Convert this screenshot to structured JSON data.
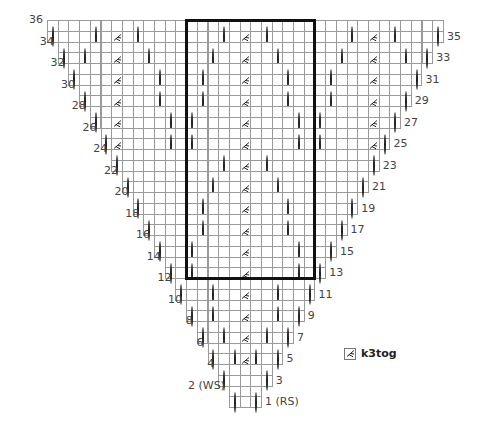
{
  "chart": {
    "columns": 37,
    "grid_origin": {
      "x": 47,
      "y": 20
    },
    "cell_w": 10.7,
    "cell_h": 10.75,
    "total_rows": 36,
    "symbols": {
      "o": "yarn over",
      "p": "purl (dot)",
      "k": "k3tog"
    },
    "repeat_box": {
      "col_start": 13,
      "col_end": 24,
      "row_top": 36,
      "row_bottom": 13
    },
    "rows": [
      {
        "row": 36,
        "label": "36",
        "side": "left",
        "start": 0,
        "end": 36,
        "marks": {
          "0": "p",
          "12": "p",
          "24": "p",
          "36": "p"
        }
      },
      {
        "row": 35,
        "label": "35",
        "side": "right",
        "start": 0,
        "end": 36,
        "marks": {
          "0": "o",
          "4": "o",
          "6": "k",
          "8": "o",
          "12": "p",
          "16": "o",
          "18": "k",
          "20": "o",
          "24": "p",
          "28": "o",
          "30": "k",
          "32": "o",
          "36": "o"
        }
      },
      {
        "row": 34,
        "label": "34",
        "side": "left",
        "start": 1,
        "end": 35,
        "marks": {
          "12": "p",
          "24": "p"
        }
      },
      {
        "row": 33,
        "label": "33",
        "side": "right",
        "start": 1,
        "end": 35,
        "marks": {
          "1": "o",
          "3": "o",
          "6": "k",
          "9": "o",
          "12": "p",
          "15": "o",
          "18": "k",
          "21": "o",
          "24": "p",
          "27": "o",
          "30": "k",
          "33": "o",
          "35": "o"
        }
      },
      {
        "row": 32,
        "label": "32",
        "side": "left",
        "start": 2,
        "end": 34,
        "marks": {
          "12": "p",
          "24": "p"
        }
      },
      {
        "row": 31,
        "label": "31",
        "side": "right",
        "start": 2,
        "end": 34,
        "marks": {
          "2": "o",
          "6": "k",
          "10": "o",
          "12": "p",
          "14": "o",
          "18": "k",
          "22": "o",
          "24": "p",
          "26": "o",
          "30": "k",
          "34": "o"
        }
      },
      {
        "row": 30,
        "label": "30",
        "side": "left",
        "start": 3,
        "end": 33,
        "marks": {
          "12": "p",
          "24": "p"
        }
      },
      {
        "row": 29,
        "label": "29",
        "side": "right",
        "start": 3,
        "end": 33,
        "marks": {
          "3": "o",
          "6": "k",
          "10": "o",
          "12": "p",
          "14": "o",
          "18": "k",
          "22": "o",
          "24": "p",
          "26": "o",
          "30": "k",
          "33": "o"
        }
      },
      {
        "row": 28,
        "label": "28",
        "side": "left",
        "start": 4,
        "end": 32,
        "marks": {
          "12": "p",
          "24": "p"
        }
      },
      {
        "row": 27,
        "label": "27",
        "side": "right",
        "start": 4,
        "end": 32,
        "marks": {
          "4": "o",
          "6": "k",
          "11": "o",
          "12": "p",
          "13": "o",
          "18": "k",
          "23": "o",
          "24": "p",
          "25": "o",
          "30": "k",
          "32": "o"
        }
      },
      {
        "row": 26,
        "label": "26",
        "side": "left",
        "start": 5,
        "end": 31,
        "marks": {
          "12": "p",
          "24": "p"
        }
      },
      {
        "row": 25,
        "label": "25",
        "side": "right",
        "start": 5,
        "end": 31,
        "marks": {
          "5": "o",
          "6": "k",
          "11": "o",
          "12": "p",
          "13": "o",
          "18": "k",
          "23": "o",
          "24": "p",
          "25": "o",
          "30": "k",
          "31": "o"
        }
      },
      {
        "row": 24,
        "label": "24",
        "side": "left",
        "start": 6,
        "end": 30,
        "marks": {
          "12": "p",
          "24": "p"
        }
      },
      {
        "row": 23,
        "label": "23",
        "side": "right",
        "start": 6,
        "end": 30,
        "marks": {
          "6": "o",
          "12": "p",
          "16": "o",
          "18": "k",
          "20": "o",
          "24": "p",
          "30": "o"
        }
      },
      {
        "row": 22,
        "label": "22",
        "side": "left",
        "start": 7,
        "end": 29,
        "marks": {
          "12": "p",
          "24": "p"
        }
      },
      {
        "row": 21,
        "label": "21",
        "side": "right",
        "start": 7,
        "end": 29,
        "marks": {
          "7": "o",
          "12": "p",
          "15": "o",
          "18": "k",
          "21": "o",
          "24": "p",
          "29": "o"
        }
      },
      {
        "row": 20,
        "label": "20",
        "side": "left",
        "start": 8,
        "end": 28,
        "marks": {
          "12": "p",
          "24": "p"
        }
      },
      {
        "row": 19,
        "label": "19",
        "side": "right",
        "start": 8,
        "end": 28,
        "marks": {
          "8": "o",
          "12": "p",
          "14": "o",
          "18": "k",
          "22": "o",
          "24": "p",
          "28": "o"
        }
      },
      {
        "row": 18,
        "label": "18",
        "side": "left",
        "start": 9,
        "end": 27,
        "marks": {
          "12": "p",
          "24": "p"
        }
      },
      {
        "row": 17,
        "label": "17",
        "side": "right",
        "start": 9,
        "end": 27,
        "marks": {
          "9": "o",
          "12": "p",
          "14": "o",
          "18": "k",
          "22": "o",
          "24": "p",
          "27": "o"
        }
      },
      {
        "row": 16,
        "label": "16",
        "side": "left",
        "start": 10,
        "end": 26,
        "marks": {
          "12": "p",
          "24": "p"
        }
      },
      {
        "row": 15,
        "label": "15",
        "side": "right",
        "start": 10,
        "end": 26,
        "marks": {
          "10": "o",
          "12": "p",
          "13": "o",
          "18": "k",
          "23": "o",
          "24": "p",
          "26": "o"
        }
      },
      {
        "row": 14,
        "label": "14",
        "side": "left",
        "start": 11,
        "end": 25,
        "marks": {
          "12": "p",
          "24": "p"
        }
      },
      {
        "row": 13,
        "label": "13",
        "side": "right",
        "start": 11,
        "end": 25,
        "marks": {
          "11": "o",
          "12": "p",
          "13": "o",
          "18": "k",
          "23": "o",
          "24": "p",
          "25": "o"
        }
      },
      {
        "row": 12,
        "label": "12",
        "side": "left",
        "start": 12,
        "end": 24,
        "marks": {
          "12": "p",
          "24": "p"
        }
      },
      {
        "row": 11,
        "label": "11",
        "side": "right",
        "start": 12,
        "end": 24,
        "marks": {
          "12": "o",
          "15": "o",
          "18": "k",
          "21": "o",
          "24": "o"
        }
      },
      {
        "row": 10,
        "label": "10",
        "side": "left",
        "start": 13,
        "end": 23,
        "marks": {}
      },
      {
        "row": 9,
        "label": "9",
        "side": "right",
        "start": 13,
        "end": 23,
        "marks": {
          "13": "o",
          "15": "o",
          "18": "k",
          "21": "o",
          "23": "o"
        }
      },
      {
        "row": 8,
        "label": "8",
        "side": "left",
        "start": 14,
        "end": 22,
        "marks": {}
      },
      {
        "row": 7,
        "label": "7",
        "side": "right",
        "start": 14,
        "end": 22,
        "marks": {
          "14": "o",
          "16": "o",
          "18": "k",
          "20": "o",
          "22": "o"
        }
      },
      {
        "row": 6,
        "label": "6",
        "side": "left",
        "start": 15,
        "end": 21,
        "marks": {}
      },
      {
        "row": 5,
        "label": "5",
        "side": "right",
        "start": 15,
        "end": 21,
        "marks": {
          "15": "o",
          "17": "o",
          "18": "k",
          "19": "o",
          "21": "o"
        }
      },
      {
        "row": 4,
        "label": "4",
        "side": "left",
        "start": 16,
        "end": 20,
        "marks": {}
      },
      {
        "row": 3,
        "label": "3",
        "side": "right",
        "start": 16,
        "end": 20,
        "marks": {
          "16": "o",
          "20": "o"
        }
      },
      {
        "row": 2,
        "label": "2 (WS)",
        "side": "left",
        "start": 17,
        "end": 19,
        "marks": {}
      },
      {
        "row": 1,
        "label": "1 (RS)",
        "side": "right",
        "start": 17,
        "end": 19,
        "marks": {
          "17": "o",
          "19": "o"
        }
      }
    ]
  },
  "legend": {
    "items": [
      {
        "symbol": "k",
        "icon": "k3tog-icon",
        "label": "k3tog"
      }
    ]
  },
  "colors": {
    "grid_line": "#9a9a9a",
    "symbol": "#222222",
    "repeat_box": "#111111",
    "label_text": "#444444"
  }
}
